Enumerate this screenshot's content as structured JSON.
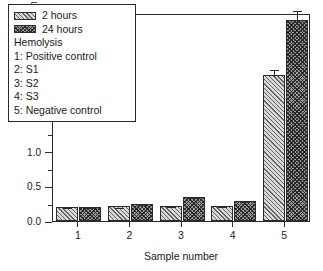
{
  "chart_data": {
    "type": "bar",
    "title": "",
    "xlabel": "Sample number",
    "ylabel": "Absorbance at 540 nm",
    "categories": [
      "1",
      "2",
      "3",
      "4",
      "5"
    ],
    "ylim": [
      0.0,
      3.0
    ],
    "yticks": [
      "0.0",
      "0.5",
      "1.0",
      "1.5",
      "2.0",
      "2.5",
      "3.0"
    ],
    "grid": false,
    "legend_position": "upper-left",
    "series": [
      {
        "name": "2 hours",
        "values": [
          0.2,
          0.21,
          0.22,
          0.22,
          2.1
        ],
        "errors": [
          0.012,
          0.012,
          0.012,
          0.012,
          0.11
        ]
      },
      {
        "name": "24 hours",
        "values": [
          0.2,
          0.25,
          0.35,
          0.29,
          2.9
        ],
        "errors": [
          0.012,
          0.012,
          0.012,
          0.012,
          0.16
        ]
      }
    ],
    "annotations": [
      "Hemolysis",
      "1: Positive control",
      "2: S1",
      "3: S2",
      "4: S3",
      "5: Negative control"
    ]
  },
  "legend": {
    "entries": [
      {
        "label": "2 hours",
        "swatch": "hatch-2h"
      },
      {
        "label": "24 hours",
        "swatch": "hatch-24h"
      }
    ],
    "notes": [
      "Hemolysis",
      "1: Positive control",
      "2: S1",
      "3: S2",
      "4: S3",
      "5: Negative control"
    ]
  },
  "colors": {
    "axis": "#2b2b2b",
    "bar_2h": "#d9d9d9",
    "bar_24h": "#9a9a9a",
    "background": "#ffffff"
  }
}
